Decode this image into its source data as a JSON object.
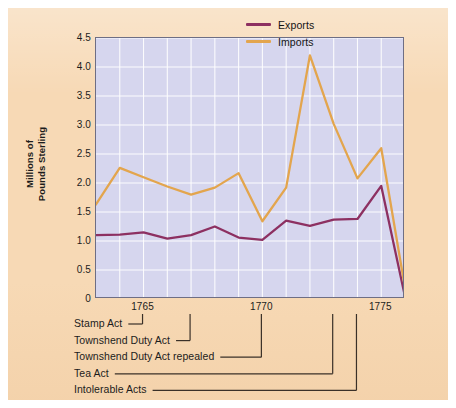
{
  "chart_data": {
    "type": "line",
    "title": "",
    "xlabel": "",
    "ylabel": "Millions of Pounds Sterling",
    "ylabel_lines": [
      "Millions of",
      "Pounds Sterling"
    ],
    "xlim": [
      1763,
      1776
    ],
    "ylim": [
      0,
      4.5
    ],
    "yticks": [
      "4.5",
      "4.0",
      "3.5",
      "3.0",
      "2.5",
      "2.0",
      "1.5",
      "1.0",
      "0.5",
      "0"
    ],
    "ytick_values": [
      4.5,
      4.0,
      3.5,
      3.0,
      2.5,
      2.0,
      1.5,
      1.0,
      0.5,
      0
    ],
    "xticks": [
      "1765",
      "1770",
      "1775"
    ],
    "xtick_values": [
      1765,
      1770,
      1775
    ],
    "grid": "both-white-gridlines",
    "legend_position": "top-right-inside",
    "x": [
      1763,
      1764,
      1765,
      1766,
      1767,
      1768,
      1769,
      1770,
      1771,
      1772,
      1773,
      1774,
      1775,
      1776
    ],
    "series": [
      {
        "name": "Exports",
        "color": "#8d3061",
        "values": [
          1.1,
          1.11,
          1.15,
          1.04,
          1.1,
          1.25,
          1.06,
          1.02,
          1.35,
          1.26,
          1.37,
          1.38,
          1.95,
          0.04
        ]
      },
      {
        "name": "Imports",
        "color": "#e3a54d",
        "values": [
          1.63,
          2.26,
          2.1,
          1.94,
          1.8,
          1.92,
          2.17,
          1.34,
          1.92,
          4.2,
          3.02,
          2.08,
          2.6,
          0.19
        ]
      }
    ],
    "annotations": [
      {
        "label": "Stamp Act",
        "year": 1765
      },
      {
        "label": "Townshend Duty Act",
        "year": 1767
      },
      {
        "label": "Townshend Duty Act repealed",
        "year": 1770
      },
      {
        "label": "Tea Act",
        "year": 1773
      },
      {
        "label": "Intolerable Acts",
        "year": 1774
      }
    ]
  },
  "legend": {
    "items": [
      {
        "label": "Exports",
        "color": "#8d3061"
      },
      {
        "label": "Imports",
        "color": "#e3a54d"
      }
    ]
  },
  "colors": {
    "panel_background": "#f7d9b5",
    "plot_background": "#d6d6ee",
    "gridline": "#ffffff",
    "axis_border": "#6e6e84",
    "exports": "#8d3061",
    "imports": "#e3a54d",
    "text": "#1c1c1c"
  }
}
